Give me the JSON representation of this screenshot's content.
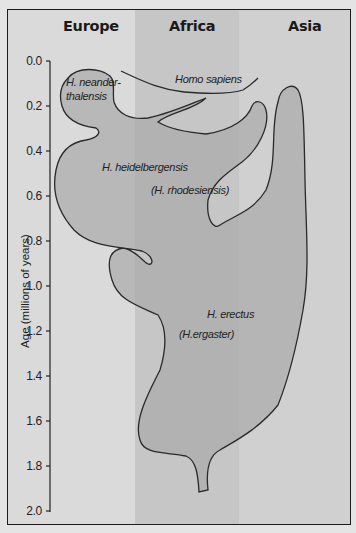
{
  "figure": {
    "regions": [
      "Europe",
      "Africa",
      "Asia"
    ],
    "y_axis": {
      "label": "Age (millions of years)",
      "ticks": [
        "0.0",
        "0.2",
        "0.4",
        "0.6",
        "0.8",
        "1.0",
        "1.2",
        "1.4",
        "1.6",
        "1.8",
        "2.0"
      ],
      "range": [
        0.0,
        2.0
      ]
    },
    "species": [
      {
        "name": "H. neander-",
        "name2": "thalensis",
        "region": "Europe",
        "age_range_my": [
          0.03,
          0.35
        ]
      },
      {
        "name": "Homo sapiens",
        "region": "Africa to Asia",
        "age_range_my": [
          0.0,
          0.2
        ]
      },
      {
        "name": "H. heidelbergensis",
        "name2": "(H. rhodesiensis)",
        "region": "Europe & Africa",
        "age_range_my": [
          0.3,
          0.85
        ]
      },
      {
        "name": "H. erectus",
        "name2": "(H.ergaster)",
        "region": "Africa & Asia",
        "age_range_my": [
          0.05,
          1.9
        ]
      }
    ],
    "colors": {
      "europe_bg": "#dadada",
      "africa_bg": "#c6c6c6",
      "asia_bg": "#d0d0d0",
      "species_fill": "#a9a9a9",
      "outline": "#2a2a2a"
    }
  }
}
